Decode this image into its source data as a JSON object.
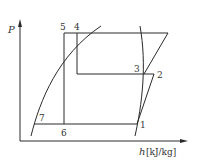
{
  "diagram": {
    "type": "pressure-enthalpy (P-h) refrigeration cycle diagram",
    "axes": {
      "y_label": "P",
      "x_label_symbol": "h",
      "x_label_unit": "[kJ/kg]"
    },
    "points": [
      {
        "id": "1",
        "label": "1"
      },
      {
        "id": "2",
        "label": "2"
      },
      {
        "id": "3",
        "label": "3"
      },
      {
        "id": "4",
        "label": "4"
      },
      {
        "id": "5",
        "label": "5"
      },
      {
        "id": "6",
        "label": "6"
      },
      {
        "id": "7",
        "label": "7"
      }
    ],
    "colors": {
      "line": "#2a2a2a",
      "text": "#333333",
      "background": "#ffffff"
    }
  }
}
